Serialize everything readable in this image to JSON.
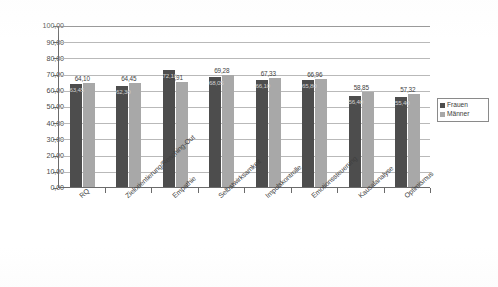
{
  "chart_data": {
    "type": "bar",
    "title": "",
    "xlabel": "",
    "ylabel": "",
    "ylim": [
      0,
      100
    ],
    "ystep": 10,
    "grid": true,
    "legend_position": "right",
    "decimal_separator": ",",
    "categories": [
      "RQ",
      "Zielorientierung/Reaching-Out",
      "Empathie",
      "Selbstwirksamkeit",
      "Impulskontrolle",
      "Emotionssteuerung",
      "Kausalanalyse",
      "Optimismus"
    ],
    "ytick_labels": [
      "0,00",
      "10,00",
      "20,00",
      "30,00",
      "40,00",
      "50,00",
      "60,00",
      "70,00",
      "80,00",
      "90,00",
      "100,00"
    ],
    "series": [
      {
        "name": "Frauen",
        "color": "#4d4d4d",
        "values": [
          63.45,
          62.3,
          72.1,
          68.05,
          66.1,
          65.8,
          56.4,
          55.4
        ],
        "labels": [
          "63,45",
          "62,30",
          "72,10",
          "68,05",
          "66,10",
          "65,80",
          "56,40",
          "55,40"
        ]
      },
      {
        "name": "Männer",
        "color": "#a8a8a8",
        "values": [
          64.1,
          64.45,
          64.91,
          69.28,
          67.33,
          66.96,
          58.85,
          57.32
        ],
        "labels": [
          "64,10",
          "64,45",
          "64,91",
          "69,28",
          "67,33",
          "66,96",
          "58,85",
          "57,32"
        ]
      }
    ],
    "point_labels": [
      "64,10",
      "64,45",
      "64,91",
      "69,28",
      "67,33",
      "66,96",
      "58,85",
      "57,32"
    ]
  },
  "legend": {
    "items": [
      {
        "label": "Frauen"
      },
      {
        "label": "Männer"
      }
    ]
  }
}
